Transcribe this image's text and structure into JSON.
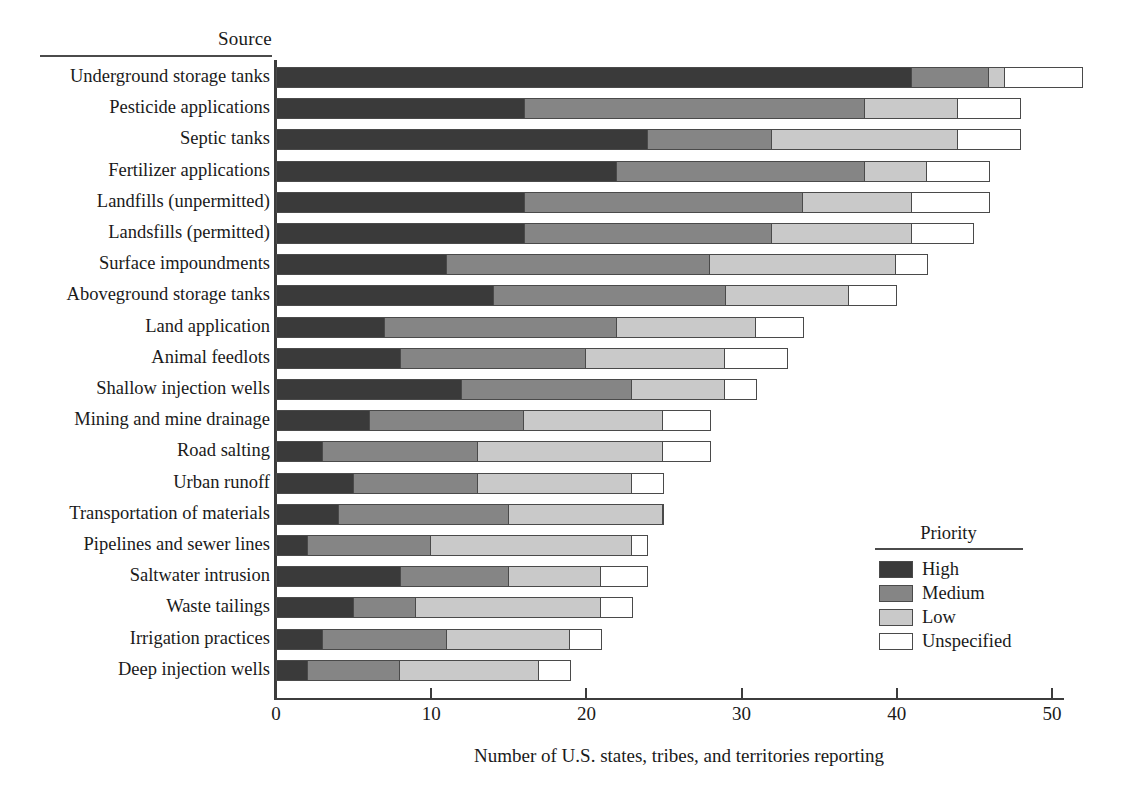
{
  "axis_header": "Source",
  "x_title": "Number of U.S. states, tribes, and territories reporting",
  "legend": {
    "title": "Priority",
    "items": [
      {
        "label": "High",
        "color": "#3a3a3a"
      },
      {
        "label": "Medium",
        "color": "#858585"
      },
      {
        "label": "Low",
        "color": "#c9c9c9"
      },
      {
        "label": "Unspecified",
        "color": "#ffffff"
      }
    ]
  },
  "chart_data": {
    "type": "bar",
    "orientation": "horizontal",
    "stacked": true,
    "title": "",
    "xlabel": "Number of U.S. states, tribes, and territories reporting",
    "ylabel": "Source",
    "xlim": [
      0,
      53
    ],
    "xticks": [
      0,
      10,
      20,
      30,
      40,
      50
    ],
    "grid": false,
    "legend_position": "inside-right",
    "legend_title": "Priority",
    "series": [
      {
        "name": "High",
        "color": "#3a3a3a",
        "values": [
          41,
          16,
          24,
          22,
          16,
          16,
          11,
          14,
          7,
          8,
          12,
          6,
          3,
          5,
          4,
          2,
          8,
          5,
          3,
          2
        ]
      },
      {
        "name": "Medium",
        "color": "#858585",
        "values": [
          5,
          22,
          8,
          16,
          18,
          16,
          17,
          15,
          15,
          12,
          11,
          10,
          10,
          8,
          11,
          8,
          7,
          4,
          8,
          6
        ]
      },
      {
        "name": "Low",
        "color": "#c9c9c9",
        "values": [
          1,
          6,
          12,
          4,
          7,
          9,
          12,
          8,
          9,
          9,
          6,
          9,
          12,
          10,
          10,
          13,
          6,
          12,
          8,
          9
        ]
      },
      {
        "name": "Unspecified",
        "color": "#ffffff",
        "values": [
          5,
          4,
          4,
          4,
          5,
          4,
          2,
          3,
          3,
          4,
          2,
          3,
          3,
          2,
          0,
          1,
          3,
          2,
          2,
          2
        ]
      }
    ],
    "categories": [
      "Underground storage tanks",
      "Pesticide applications",
      "Septic tanks",
      "Fertilizer applications",
      "Landfills (unpermitted)",
      "Landsfills (permitted)",
      "Surface impoundments",
      "Aboveground storage tanks",
      "Land application",
      "Animal feedlots",
      "Shallow injection wells",
      "Mining and mine drainage",
      "Road salting",
      "Urban runoff",
      "Transportation of materials",
      "Pipelines and sewer lines",
      "Saltwater intrusion",
      "Waste tailings",
      "Irrigation practices",
      "Deep injection wells"
    ],
    "totals": [
      52,
      48,
      48,
      46,
      46,
      45,
      42,
      40,
      34,
      33,
      31,
      28,
      28,
      25,
      25,
      24,
      24,
      23,
      21,
      19
    ]
  }
}
